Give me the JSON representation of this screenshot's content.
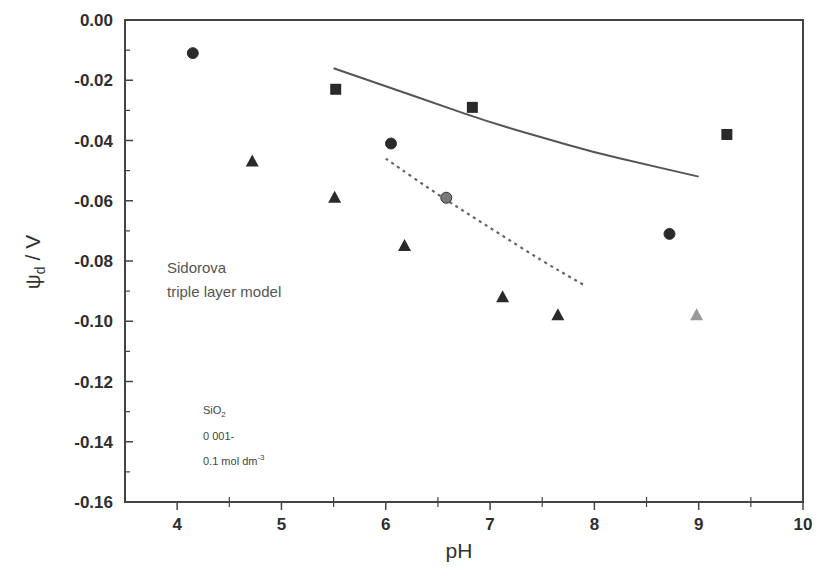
{
  "chart_data": {
    "type": "scatter",
    "title": "",
    "xlabel": "pH",
    "ylabel": "ψd / V",
    "ylabel_main": "ψ",
    "ylabel_sub": "d",
    "ylabel_unit": " / V",
    "xlim": [
      3.5,
      10
    ],
    "ylim": [
      -0.16,
      0.0
    ],
    "grid": false,
    "legend": null,
    "x_ticks": [
      "4",
      "5",
      "6",
      "7",
      "8",
      "9",
      "10"
    ],
    "x_tick_values": [
      4,
      5,
      6,
      7,
      8,
      9,
      10
    ],
    "y_ticks": [
      "0.00",
      "-0.02",
      "-0.04",
      "-0.06",
      "-0.08",
      "-0.10",
      "-0.12",
      "-0.14",
      "-0.16"
    ],
    "y_tick_values": [
      0.0,
      -0.02,
      -0.04,
      -0.06,
      -0.08,
      -0.1,
      -0.12,
      -0.14,
      -0.16
    ],
    "series": [
      {
        "name": "circles",
        "marker": "circle",
        "color": "#2a2a2a",
        "points": [
          [
            4.15,
            -0.011
          ],
          [
            6.05,
            -0.041
          ],
          [
            8.72,
            -0.071
          ]
        ]
      },
      {
        "name": "circle-grey",
        "marker": "circle",
        "color": "#7a7a7a",
        "points": [
          [
            6.58,
            -0.059
          ]
        ]
      },
      {
        "name": "squares",
        "marker": "square",
        "color": "#2a2a2a",
        "points": [
          [
            5.52,
            -0.023
          ],
          [
            6.83,
            -0.029
          ],
          [
            9.27,
            -0.038
          ]
        ]
      },
      {
        "name": "triangles",
        "marker": "triangle",
        "color": "#2a2a2a",
        "points": [
          [
            4.72,
            -0.047
          ],
          [
            5.51,
            -0.059
          ],
          [
            6.18,
            -0.075
          ],
          [
            7.12,
            -0.092
          ],
          [
            7.65,
            -0.098
          ]
        ]
      },
      {
        "name": "triangle-grey",
        "marker": "triangle",
        "color": "#9a9a9a",
        "points": [
          [
            8.98,
            -0.098
          ]
        ]
      },
      {
        "name": "model-solid",
        "type": "line",
        "style": "solid",
        "color": "#555555",
        "points": [
          [
            5.5,
            -0.016
          ],
          [
            6.0,
            -0.022
          ],
          [
            6.5,
            -0.028
          ],
          [
            7.0,
            -0.034
          ],
          [
            7.5,
            -0.039
          ],
          [
            8.0,
            -0.044
          ],
          [
            8.5,
            -0.048
          ],
          [
            9.0,
            -0.052
          ]
        ]
      },
      {
        "name": "model-dotted",
        "type": "line",
        "style": "dotted",
        "color": "#666666",
        "points": [
          [
            6.0,
            -0.046
          ],
          [
            6.5,
            -0.058
          ],
          [
            7.0,
            -0.069
          ],
          [
            7.5,
            -0.08
          ],
          [
            7.9,
            -0.088
          ]
        ]
      }
    ],
    "annotations": [
      {
        "text": "Sidorova",
        "x": 3.65,
        "y": -0.081
      },
      {
        "text": "triple layer model",
        "x": 3.65,
        "y": -0.089
      },
      {
        "text": "SiO2",
        "x": 3.85,
        "y": -0.131
      },
      {
        "text": "0 001-",
        "x": 3.85,
        "y": -0.1395
      },
      {
        "text": "0.1 mol dm-3",
        "x": 3.85,
        "y": -0.148
      }
    ]
  },
  "labels": {
    "model_line1": "Sidorova",
    "model_line2": "triple layer model",
    "sio2_main": "SiO",
    "sio2_sub": "2",
    "conc_line1": "0 001-",
    "conc_line2": "0.1 mol dm",
    "conc_sup": "-3"
  }
}
